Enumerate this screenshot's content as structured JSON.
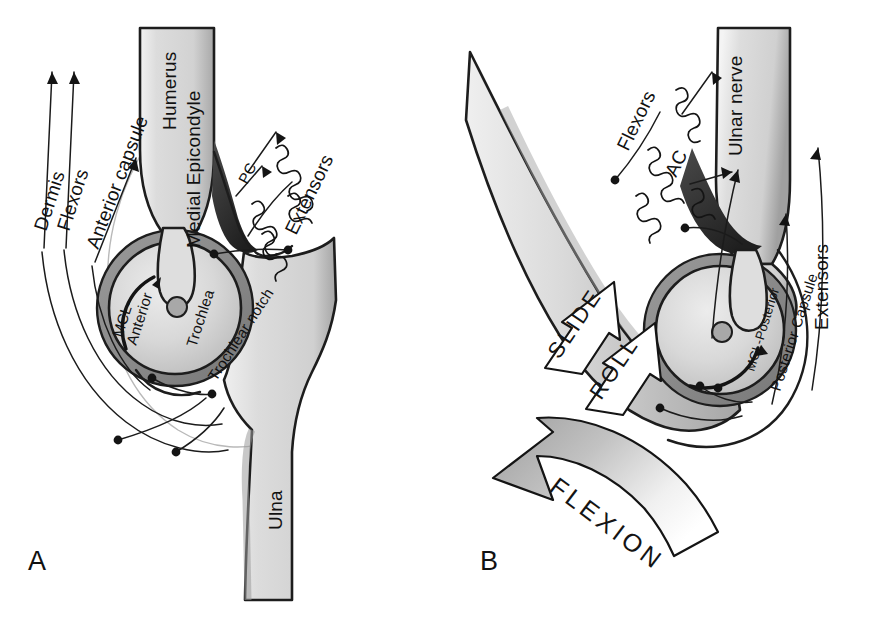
{
  "figure": {
    "background_color": "#ffffff",
    "ink_color": "#141414",
    "bone_fill": "#d9d9d9",
    "bone_shadow": "#a9a9a9",
    "capsule_fill": "#8f8f8f",
    "cavity_dark": "#3a3a3a"
  },
  "panels": [
    {
      "id": "A",
      "label": "A",
      "caption": "Extension",
      "labels": [
        {
          "key": "dermis",
          "text": "Dermis"
        },
        {
          "key": "flexors",
          "text": "Flexors"
        },
        {
          "key": "anterior_capsule",
          "text": "Anterior capsule"
        },
        {
          "key": "humerus",
          "text": "Humerus"
        },
        {
          "key": "medial_epicondyle",
          "text": "Medial Epicondyle"
        },
        {
          "key": "extensors",
          "text": "Extensors"
        },
        {
          "key": "pc",
          "text": "PC"
        },
        {
          "key": "mcl_anterior",
          "text": "MCL-\nAnterior"
        },
        {
          "key": "mcl_anterior_l1",
          "text": "MCL-"
        },
        {
          "key": "mcl_anterior_l2",
          "text": "Anterior"
        },
        {
          "key": "trochlea",
          "text": "Trochlea"
        },
        {
          "key": "trochlear_notch",
          "text": "Trochlear notch"
        },
        {
          "key": "ulna",
          "text": "Ulna"
        }
      ]
    },
    {
      "id": "B",
      "label": "B",
      "caption": "Flexion",
      "labels": [
        {
          "key": "flexors",
          "text": "Flexors"
        },
        {
          "key": "ac",
          "text": "AC"
        },
        {
          "key": "ulnar_nerve",
          "text": "Ulnar nerve"
        },
        {
          "key": "extensors",
          "text": "Extensors"
        },
        {
          "key": "posterior_capsule",
          "text": "Posterior Capsule"
        },
        {
          "key": "mcl_posterior",
          "text": "MCL-Posterior"
        },
        {
          "key": "slide",
          "text": "SLIDE"
        },
        {
          "key": "roll",
          "text": "ROLL"
        },
        {
          "key": "flexion",
          "text": "FLEXION"
        }
      ]
    }
  ],
  "motion_arrows": [
    {
      "key": "slide",
      "text": "SLIDE",
      "style": "outline"
    },
    {
      "key": "roll",
      "text": "ROLL",
      "style": "outline"
    },
    {
      "key": "flexion",
      "text": "FLEXION",
      "style": "gradient-gray"
    }
  ]
}
